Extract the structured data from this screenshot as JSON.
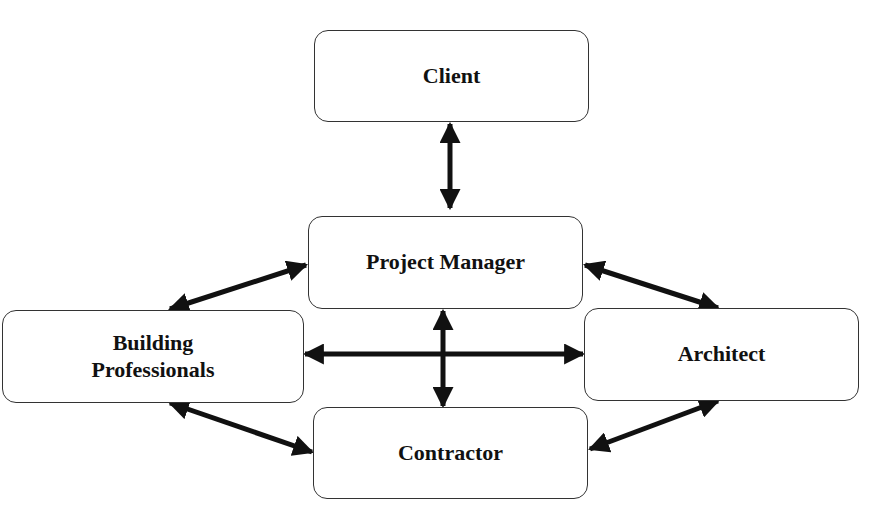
{
  "diagram": {
    "nodes": [
      {
        "id": "client",
        "label": "Client"
      },
      {
        "id": "project_manager",
        "label": "Project Manager"
      },
      {
        "id": "building_professionals",
        "label_line1": "Building",
        "label_line2": "Professionals"
      },
      {
        "id": "architect",
        "label": "Architect"
      },
      {
        "id": "contractor",
        "label": "Contractor"
      }
    ],
    "edges": [
      {
        "from": "client",
        "to": "project_manager",
        "type": "bidirectional"
      },
      {
        "from": "project_manager",
        "to": "building_professionals",
        "type": "bidirectional"
      },
      {
        "from": "project_manager",
        "to": "architect",
        "type": "bidirectional"
      },
      {
        "from": "project_manager",
        "to": "contractor",
        "type": "bidirectional"
      },
      {
        "from": "building_professionals",
        "to": "architect",
        "type": "bidirectional"
      },
      {
        "from": "building_professionals",
        "to": "contractor",
        "type": "bidirectional"
      },
      {
        "from": "architect",
        "to": "contractor",
        "type": "bidirectional"
      }
    ],
    "colors": {
      "stroke": "#111111",
      "box_border": "#333333",
      "background": "#ffffff"
    }
  }
}
